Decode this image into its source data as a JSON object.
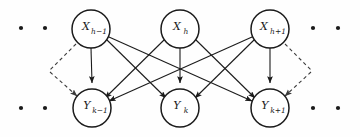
{
  "diagram": {
    "type": "directed-graph",
    "canvas": {
      "width": 360,
      "height": 137,
      "background": "#fefefe"
    },
    "colors": {
      "node_stroke": "#1b1b1b",
      "node_fill": "#ffffff",
      "edge_solid": "#1b1b1b",
      "edge_dashed": "#3a3a3a",
      "dot": "#1a1a1a",
      "label": "#1a1a1a"
    },
    "nodes": {
      "top": [
        {
          "id": "x_hm1",
          "base": "X",
          "sub": "h−1",
          "cx": 91,
          "cy": 29,
          "r": 19
        },
        {
          "id": "x_h",
          "base": "X",
          "sub": "h",
          "cx": 180,
          "cy": 29,
          "r": 19
        },
        {
          "id": "x_hp1",
          "base": "X",
          "sub": "h+1",
          "cx": 270,
          "cy": 29,
          "r": 19
        }
      ],
      "bottom": [
        {
          "id": "y_km1",
          "base": "Y",
          "sub": "k−1",
          "cx": 92,
          "cy": 108,
          "r": 19
        },
        {
          "id": "y_k",
          "base": "Y",
          "sub": "k",
          "cx": 180,
          "cy": 108,
          "r": 19
        },
        {
          "id": "y_kp1",
          "base": "Y",
          "sub": "k+1",
          "cx": 270,
          "cy": 108,
          "r": 19
        }
      ]
    },
    "edges_solid": [
      {
        "from": "x_hm1",
        "to": "y_km1"
      },
      {
        "from": "x_hm1",
        "to": "y_k"
      },
      {
        "from": "x_hm1",
        "to": "y_kp1"
      },
      {
        "from": "x_h",
        "to": "y_km1"
      },
      {
        "from": "x_h",
        "to": "y_k"
      },
      {
        "from": "x_h",
        "to": "y_kp1"
      },
      {
        "from": "x_hp1",
        "to": "y_km1"
      },
      {
        "from": "x_hp1",
        "to": "y_k"
      },
      {
        "from": "x_hp1",
        "to": "y_kp1"
      }
    ],
    "edges_dashed": [
      {
        "id": "left-incoming-to-y",
        "note": "dashed arrow from off-screen upper-left into Y k-1"
      },
      {
        "id": "left-outgoing-from-x",
        "note": "dashed line from X h-1 toward off-screen lower-left"
      },
      {
        "id": "right-incoming-to-y",
        "note": "dashed arrow from off-screen upper-right into Y k+1"
      },
      {
        "id": "right-outgoing-from-x",
        "note": "dashed line from X h+1 toward off-screen lower-right"
      }
    ],
    "ellipsis_dots": [
      {
        "cx": 21,
        "cy": 28
      },
      {
        "cx": 45,
        "cy": 28
      },
      {
        "cx": 21,
        "cy": 108
      },
      {
        "cx": 45,
        "cy": 108
      },
      {
        "cx": 313,
        "cy": 28
      },
      {
        "cx": 338,
        "cy": 28
      },
      {
        "cx": 313,
        "cy": 108
      },
      {
        "cx": 338,
        "cy": 108
      }
    ]
  }
}
